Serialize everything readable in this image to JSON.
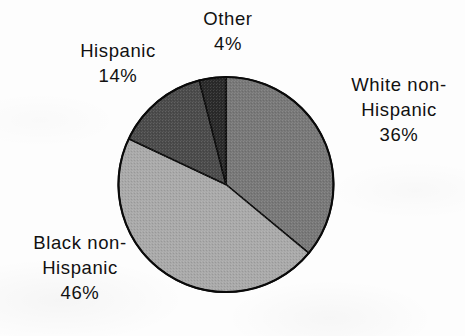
{
  "chart_data": {
    "type": "pie",
    "title": "",
    "subtitle": "",
    "xlabel": "",
    "ylabel": "",
    "legend_position": "none",
    "grid": false,
    "categories": [
      "White non-Hispanic",
      "Black non-Hispanic",
      "Hispanic",
      "Other"
    ],
    "values": [
      36,
      46,
      14,
      4
    ],
    "value_unit": "percent",
    "value_labels": [
      "36%",
      "46%",
      "14%",
      "4%"
    ],
    "start_angle_deg": 0,
    "direction": "clockwise",
    "slice_colors": [
      "#787878",
      "#a9a9a9",
      "#4b4b4b",
      "#2a2a2a"
    ],
    "outline_color": "#000000",
    "background_color": "#fdfdfd",
    "slices": [
      {
        "name": "White non-Hispanic",
        "value": 36,
        "label_lines": [
          "White non-",
          "Hispanic"
        ],
        "percent_label": "36%",
        "color": "#787878",
        "label_position": "right"
      },
      {
        "name": "Black non-Hispanic",
        "value": 46,
        "label_lines": [
          "Black non-",
          "Hispanic"
        ],
        "percent_label": "46%",
        "color": "#a9a9a9",
        "label_position": "bottom-left"
      },
      {
        "name": "Hispanic",
        "value": 14,
        "label_lines": [
          "Hispanic"
        ],
        "percent_label": "14%",
        "color": "#4b4b4b",
        "label_position": "top-left"
      },
      {
        "name": "Other",
        "value": 4,
        "label_lines": [
          "Other"
        ],
        "percent_label": "4%",
        "color": "#2a2a2a",
        "label_position": "top"
      }
    ]
  },
  "labels": {
    "other": {
      "line1": "Other",
      "percent": "4%"
    },
    "hispanic": {
      "line1": "Hispanic",
      "percent": "14%"
    },
    "white_non_hispanic": {
      "line1": "White non-",
      "line2": "Hispanic",
      "percent": "36%"
    },
    "black_non_hispanic": {
      "line1": "Black non-",
      "line2": "Hispanic",
      "percent": "46%"
    }
  }
}
